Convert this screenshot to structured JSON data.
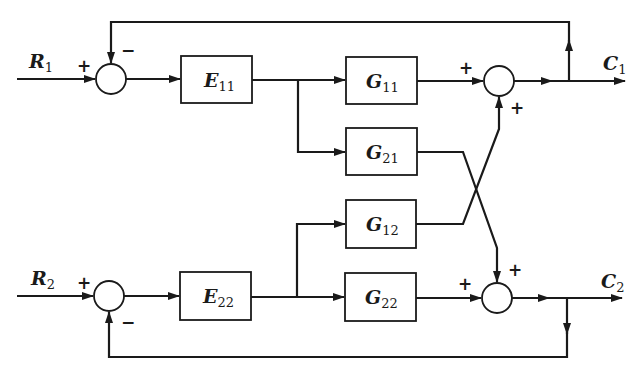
{
  "diagram": {
    "type": "block-diagram",
    "inputs": [
      {
        "id": "R1",
        "label": "R",
        "sub": "1"
      },
      {
        "id": "R2",
        "label": "R",
        "sub": "2"
      }
    ],
    "outputs": [
      {
        "id": "C1",
        "label": "C",
        "sub": "1"
      },
      {
        "id": "C2",
        "label": "C",
        "sub": "2"
      }
    ],
    "blocks": [
      {
        "id": "E11",
        "label": "E",
        "sub": "11"
      },
      {
        "id": "E22",
        "label": "E",
        "sub": "22"
      },
      {
        "id": "G11",
        "label": "G",
        "sub": "11"
      },
      {
        "id": "G21",
        "label": "G",
        "sub": "21"
      },
      {
        "id": "G12",
        "label": "G",
        "sub": "12"
      },
      {
        "id": "G22",
        "label": "G",
        "sub": "22"
      }
    ],
    "summing_junctions": [
      {
        "id": "S1",
        "signs": {
          "input": "+",
          "feedback": "−"
        }
      },
      {
        "id": "S2",
        "signs": {
          "input": "+",
          "feedback": "−"
        }
      },
      {
        "id": "S3",
        "signs": {
          "left": "+",
          "bottom": "+"
        }
      },
      {
        "id": "S4",
        "signs": {
          "left": "+",
          "top": "+"
        }
      }
    ],
    "connections": [
      "R1 → S1(+)",
      "S1 → E11",
      "E11 → G11",
      "E11 → G21",
      "G11 → S3(+)",
      "G12 → S3(+)",
      "S3 → C1",
      "C1 → S1(−)",
      "R2 → S2(+)",
      "S2 → E22",
      "E22 → G12",
      "E22 → G22",
      "G22 → S4(+)",
      "G21 → S4(+)",
      "S4 → C2",
      "C2 → S2(−)"
    ]
  }
}
